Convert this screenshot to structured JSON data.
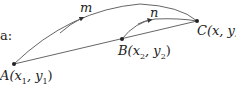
{
  "intro_fragment": "a:",
  "points": {
    "A": {
      "label": "A(x",
      "sub1": "1",
      "mid": ", y",
      "sub2": "1",
      "end": ")"
    },
    "B": {
      "label": "B(x",
      "sub1": "2",
      "mid": ", y",
      "sub2": "2",
      "end": ")"
    },
    "C": {
      "label": "C(x, y)"
    }
  },
  "paths": {
    "m": "m",
    "n": "n"
  },
  "colors": {
    "line": "#555555",
    "text": "#222222"
  }
}
